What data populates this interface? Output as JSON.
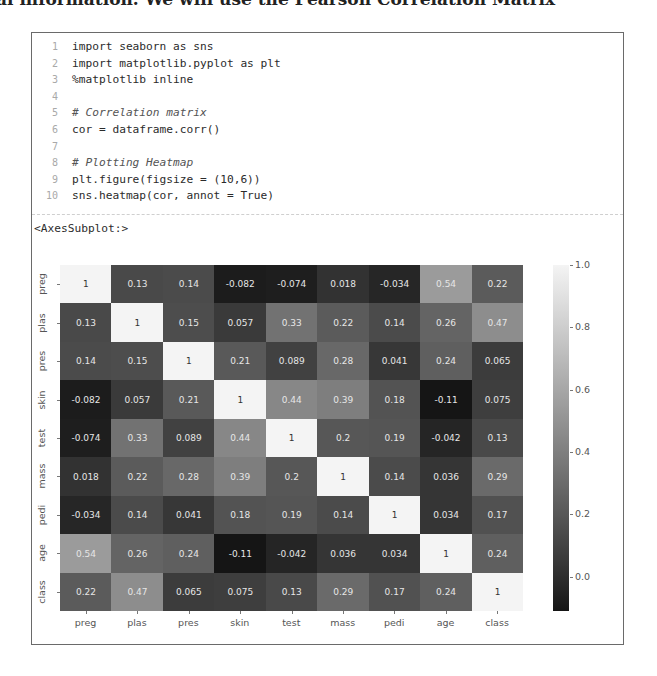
{
  "page": {
    "top_text": "al information. We will use the Pearson Correlation Matrix"
  },
  "notebook_cell": {
    "code_lines": [
      {
        "num": "1",
        "text": "import seaborn as sns",
        "comment": false
      },
      {
        "num": "2",
        "text": "import matplotlib.pyplot as plt",
        "comment": false
      },
      {
        "num": "3",
        "text": "%matplotlib inline",
        "comment": false
      },
      {
        "num": "4",
        "text": "",
        "comment": false
      },
      {
        "num": "5",
        "text": "# Correlation matrix",
        "comment": true
      },
      {
        "num": "6",
        "text": "cor = dataframe.corr()",
        "comment": false
      },
      {
        "num": "7",
        "text": "",
        "comment": false
      },
      {
        "num": "8",
        "text": "# Plotting Heatmap",
        "comment": true
      },
      {
        "num": "9",
        "text": "plt.figure(figsize = (10,6))",
        "comment": false
      },
      {
        "num": "10",
        "text": "sns.heatmap(cor, annot = True)",
        "comment": false
      }
    ],
    "output_text": "<AxesSubplot:>"
  },
  "chart_data": {
    "type": "heatmap",
    "title": "",
    "xlabel": "",
    "ylabel": "",
    "x_labels": [
      "preg",
      "plas",
      "pres",
      "skin",
      "test",
      "mass",
      "pedi",
      "age",
      "class"
    ],
    "y_labels": [
      "preg",
      "plas",
      "pres",
      "skin",
      "test",
      "mass",
      "pedi",
      "age",
      "class"
    ],
    "values": [
      [
        1,
        0.13,
        0.14,
        -0.082,
        -0.074,
        0.018,
        -0.034,
        0.54,
        0.22
      ],
      [
        0.13,
        1,
        0.15,
        0.057,
        0.33,
        0.22,
        0.14,
        0.26,
        0.47
      ],
      [
        0.14,
        0.15,
        1,
        0.21,
        0.089,
        0.28,
        0.041,
        0.24,
        0.065
      ],
      [
        -0.082,
        0.057,
        0.21,
        1,
        0.44,
        0.39,
        0.18,
        -0.11,
        0.075
      ],
      [
        -0.074,
        0.33,
        0.089,
        0.44,
        1,
        0.2,
        0.19,
        -0.042,
        0.13
      ],
      [
        0.018,
        0.22,
        0.28,
        0.39,
        0.2,
        1,
        0.14,
        0.036,
        0.29
      ],
      [
        -0.034,
        0.14,
        0.041,
        0.18,
        0.19,
        0.14,
        1,
        0.034,
        0.17
      ],
      [
        0.54,
        0.26,
        0.24,
        -0.11,
        -0.042,
        0.036,
        0.034,
        1,
        0.24
      ],
      [
        0.22,
        0.47,
        0.065,
        0.075,
        0.13,
        0.29,
        0.17,
        0.24,
        1
      ]
    ],
    "annot": true,
    "colorbar": {
      "ticks": [
        "1.0",
        "0.8",
        "0.6",
        "0.4",
        "0.2",
        "0.0"
      ],
      "tick_values": [
        1.0,
        0.8,
        0.6,
        0.4,
        0.2,
        0.0
      ],
      "vmin": -0.11,
      "vmax": 1.0
    },
    "colors": {
      "low": "#151515",
      "high": "#f4f4f4"
    }
  }
}
